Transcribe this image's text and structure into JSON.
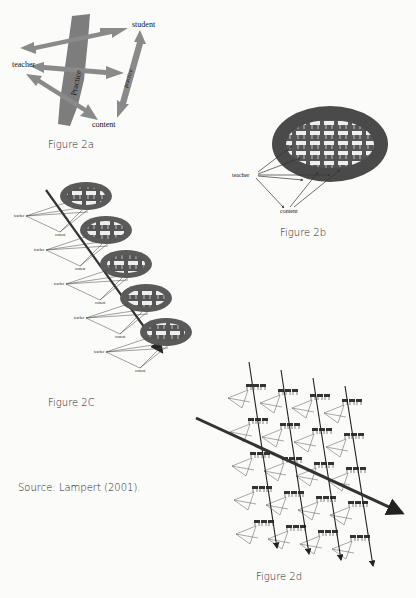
{
  "figures": {
    "fig2a": {
      "caption": "Figure 2a",
      "labels": {
        "teacher": "teacher",
        "student": "student",
        "content": "content",
        "practice_main": "Practice",
        "practice_small": "practice"
      }
    },
    "fig2b": {
      "caption": "Figure 2b",
      "labels": {
        "teacher": "teacher",
        "content": "content"
      }
    },
    "fig2c": {
      "caption": "Figure 2C",
      "node_labels": {
        "teacher": "teacher",
        "content": "content"
      },
      "classroom_count": 5
    },
    "fig2d": {
      "caption": "Figure 2d",
      "vertical_arrow_count": 4,
      "grid_rows": 5,
      "grid_cols": 4
    }
  },
  "source": "Source: Lampert (2001)."
}
